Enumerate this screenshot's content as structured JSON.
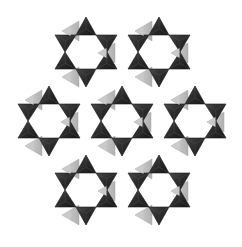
{
  "diagram": {
    "type": "polyhedral-ring-framework",
    "colors": {
      "background": "#ffffff",
      "tetra_dark": "#2b2b2b",
      "tetra_dark_shade": "#1a1a1a",
      "tetra_dark_highlight": "#4a4a4a",
      "tetra_light": "#c4c4c4",
      "tetra_light_shade": "#a8a8a8"
    },
    "ring_geometry": {
      "dark_triangles": [
        [
          [
            0,
            -35
          ],
          [
            -10,
            -17
          ],
          [
            10,
            -17
          ]
        ],
        [
          [
            -31,
            -17
          ],
          [
            -10,
            -17
          ],
          [
            -21,
            0
          ]
        ],
        [
          [
            10,
            -17
          ],
          [
            31,
            -17
          ],
          [
            21,
            0
          ]
        ],
        [
          [
            -21,
            0
          ],
          [
            -31,
            17
          ],
          [
            -10,
            17
          ]
        ],
        [
          [
            21,
            0
          ],
          [
            10,
            17
          ],
          [
            31,
            17
          ]
        ],
        [
          [
            -10,
            17
          ],
          [
            10,
            17
          ],
          [
            0,
            35
          ]
        ]
      ],
      "light_triangles": [
        [
          [
            -24,
            -21
          ],
          [
            -7,
            -31
          ],
          [
            -7,
            -11
          ]
        ],
        [
          [
            12,
            1
          ],
          [
            29,
            -9
          ],
          [
            29,
            11
          ]
        ],
        [
          [
            -24,
            25
          ],
          [
            -7,
            15
          ],
          [
            -7,
            35
          ]
        ]
      ]
    },
    "rings": [
      {
        "id": "ring-top-left",
        "cx": 86,
        "cy": 52
      },
      {
        "id": "ring-top-right",
        "cx": 159,
        "cy": 52
      },
      {
        "id": "ring-middle-left",
        "cx": 49,
        "cy": 121
      },
      {
        "id": "ring-middle-center",
        "cx": 122,
        "cy": 121
      },
      {
        "id": "ring-middle-right",
        "cx": 195,
        "cy": 121
      },
      {
        "id": "ring-bottom-left",
        "cx": 86,
        "cy": 190
      },
      {
        "id": "ring-bottom-right",
        "cx": 159,
        "cy": 190
      }
    ]
  }
}
